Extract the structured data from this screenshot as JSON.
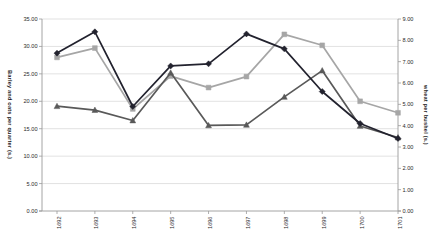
{
  "chart_data": {
    "type": "line",
    "title": "",
    "categories": [
      "1692",
      "1693",
      "1694",
      "1695",
      "1696",
      "1697",
      "1698",
      "1699",
      "1700",
      "1701"
    ],
    "series": [
      {
        "name": "barley per quarter",
        "axis": "left",
        "marker": "square",
        "color": "#a6a6a6",
        "values": [
          28.0,
          29.7,
          18.6,
          24.6,
          22.5,
          24.5,
          32.2,
          30.2,
          20.0,
          17.9
        ]
      },
      {
        "name": "oats per quarter",
        "axis": "left",
        "marker": "triangle",
        "color": "#595959",
        "values": [
          19.1,
          18.4,
          16.5,
          25.2,
          15.6,
          15.7,
          20.8,
          25.6,
          15.5,
          13.4
        ]
      },
      {
        "name": "wheat per bushel",
        "axis": "right",
        "marker": "diamond",
        "color": "#22222e",
        "values": [
          7.4,
          8.4,
          4.9,
          6.8,
          6.9,
          8.3,
          7.6,
          5.6,
          4.1,
          3.4
        ]
      }
    ],
    "left_axis": {
      "title": "Barley and oats per quarter (s.)",
      "min": 0,
      "max": 35,
      "step": 5,
      "tick_labels": [
        "0.00",
        "5.00",
        "10.00",
        "15.00",
        "20.00",
        "25.00",
        "30.00",
        "35.00"
      ]
    },
    "right_axis": {
      "title": "wheat per bushel (s.)",
      "min": 0,
      "max": 9,
      "step": 1,
      "tick_labels": [
        "0.00",
        "1.00",
        "2.00",
        "3.00",
        "4.00",
        "5.00",
        "6.00",
        "7.00",
        "8.00",
        "9.00"
      ]
    },
    "grid": true,
    "legend": "none",
    "colors": {
      "gridline": "#d4d4d4",
      "axis": "#9a9a9a",
      "label": "#2b2b2b"
    }
  }
}
